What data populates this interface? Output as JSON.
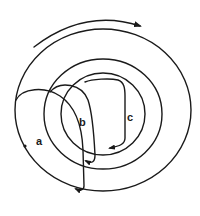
{
  "diagram": {
    "labels": {
      "a": "a",
      "b": "b",
      "c": "c"
    },
    "colors": {
      "stroke": "#1a1a1a",
      "background": "#ffffff"
    },
    "rings": [
      {
        "name": "outer-ring",
        "cx": 103,
        "cy": 110,
        "rx": 88,
        "ry": 81
      },
      {
        "name": "middle-ring",
        "cx": 103,
        "cy": 114,
        "rx": 59,
        "ry": 55
      },
      {
        "name": "inner-ring",
        "cx": 103,
        "cy": 114,
        "rx": 42,
        "ry": 41
      }
    ],
    "rotation_arrow": {
      "direction": "clockwise"
    },
    "loops": [
      {
        "id": "a",
        "label": "a"
      },
      {
        "id": "b",
        "label": "b"
      },
      {
        "id": "c",
        "label": "c"
      }
    ]
  }
}
